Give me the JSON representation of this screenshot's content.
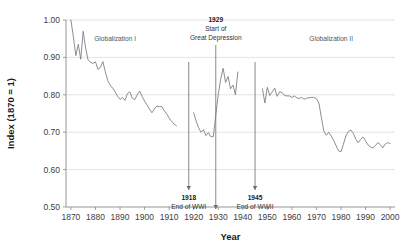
{
  "chart_data": {
    "type": "line",
    "title": "",
    "xlabel": "Year",
    "ylabel": "Index (1870 = 1)",
    "xlim": [
      1868,
      2002
    ],
    "ylim": [
      0.5,
      1.0
    ],
    "xticks": [
      1870,
      1880,
      1890,
      1900,
      1910,
      1920,
      1930,
      1940,
      1950,
      1960,
      1970,
      1980,
      1990,
      2000
    ],
    "yticks": [
      "0.50",
      "0.60",
      "0.70",
      "0.80",
      "0.90",
      "1.00"
    ],
    "grid": true,
    "legend": "none",
    "series": [
      {
        "name": "Globalization I (1870-1913)",
        "x": [
          1870,
          1871,
          1872,
          1873,
          1874,
          1875,
          1876,
          1877,
          1878,
          1879,
          1880,
          1881,
          1882,
          1883,
          1884,
          1885,
          1886,
          1887,
          1888,
          1889,
          1890,
          1891,
          1892,
          1893,
          1894,
          1895,
          1896,
          1897,
          1898,
          1899,
          1900,
          1901,
          1902,
          1903,
          1904,
          1905,
          1906,
          1907,
          1908,
          1909,
          1910,
          1911,
          1912,
          1913
        ],
        "values": [
          1.0,
          0.955,
          0.905,
          0.935,
          0.895,
          0.97,
          0.925,
          0.893,
          0.887,
          0.884,
          0.888,
          0.868,
          0.873,
          0.889,
          0.862,
          0.838,
          0.826,
          0.818,
          0.808,
          0.796,
          0.788,
          0.793,
          0.785,
          0.803,
          0.808,
          0.791,
          0.787,
          0.8,
          0.81,
          0.796,
          0.783,
          0.773,
          0.762,
          0.752,
          0.762,
          0.77,
          0.768,
          0.769,
          0.758,
          0.749,
          0.738,
          0.729,
          0.722,
          0.717
        ]
      },
      {
        "name": "Interwar (1920-1938)",
        "x": [
          1920,
          1921,
          1922,
          1923,
          1924,
          1925,
          1926,
          1927,
          1928,
          1929,
          1930,
          1931,
          1932,
          1933,
          1934,
          1935,
          1936,
          1937,
          1938
        ],
        "values": [
          0.752,
          0.73,
          0.712,
          0.7,
          0.707,
          0.691,
          0.699,
          0.688,
          0.688,
          0.745,
          0.8,
          0.842,
          0.871,
          0.833,
          0.849,
          0.816,
          0.826,
          0.8,
          0.861
        ]
      },
      {
        "name": "Post-WWII (1948-2000)",
        "x": [
          1948,
          1949,
          1950,
          1951,
          1952,
          1953,
          1954,
          1955,
          1956,
          1957,
          1958,
          1959,
          1960,
          1961,
          1962,
          1963,
          1964,
          1965,
          1966,
          1967,
          1968,
          1969,
          1970,
          1971,
          1972,
          1973,
          1974,
          1975,
          1976,
          1977,
          1978,
          1979,
          1980,
          1981,
          1982,
          1983,
          1984,
          1985,
          1986,
          1987,
          1988,
          1989,
          1990,
          1991,
          1992,
          1993,
          1994,
          1995,
          1996,
          1997,
          1998,
          1999,
          2000
        ],
        "values": [
          0.816,
          0.778,
          0.82,
          0.798,
          0.808,
          0.818,
          0.796,
          0.808,
          0.806,
          0.798,
          0.797,
          0.797,
          0.793,
          0.797,
          0.792,
          0.79,
          0.793,
          0.788,
          0.791,
          0.792,
          0.793,
          0.793,
          0.789,
          0.778,
          0.74,
          0.703,
          0.692,
          0.7,
          0.69,
          0.678,
          0.664,
          0.65,
          0.648,
          0.668,
          0.69,
          0.702,
          0.706,
          0.697,
          0.682,
          0.672,
          0.681,
          0.687,
          0.677,
          0.666,
          0.661,
          0.658,
          0.664,
          0.672,
          0.667,
          0.658,
          0.668,
          0.672,
          0.67
        ]
      }
    ],
    "era_labels": [
      {
        "text": "Globalization I",
        "x": 1888,
        "y": 0.945
      },
      {
        "text": "Globalization II",
        "x": 1976,
        "y": 0.945
      }
    ],
    "annotations": [
      {
        "year_label": "1929",
        "description_line1": "Start of",
        "description_line2": "Great Depression",
        "x": 1929,
        "position": "top"
      },
      {
        "year_label": "1918",
        "description_line1": "End of WWI",
        "description_line2": "",
        "x": 1918,
        "position": "bottom"
      },
      {
        "year_label": "1945",
        "description_line1": "End of WWII",
        "description_line2": "",
        "x": 1945,
        "position": "bottom"
      }
    ]
  },
  "colors": {
    "line": "#7a7a7a",
    "grid": "#d9d9d9",
    "axis": "#8a8a8a",
    "text": "#333333",
    "background": "#ffffff"
  }
}
